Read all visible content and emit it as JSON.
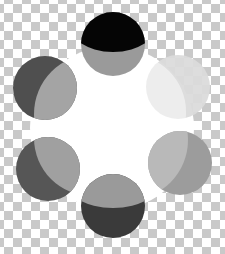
{
  "image": {
    "description": "Six overlapping two-tone grayscale circles arranged in a ring around a white center disc, on a transparency checkerboard background",
    "background": {
      "pattern": "checkerboard",
      "tile_px": 9,
      "colors": [
        "#ffffff",
        "#c9c9c9"
      ]
    },
    "center_disc": {
      "cx": 112,
      "cy": 128,
      "r": 82,
      "color": "#ffffff"
    },
    "circles": [
      {
        "name": "top",
        "cx": 113,
        "cy": 44,
        "r": 32,
        "dark": "#050505",
        "light": "#9a9a9a",
        "split": "horizontal-top-dark"
      },
      {
        "name": "upper-right",
        "cx": 178,
        "cy": 87,
        "r": 32,
        "dark": "#d9d9d9",
        "light": "#ebebeb",
        "split": "crescent-left-light"
      },
      {
        "name": "lower-right",
        "cx": 180,
        "cy": 163,
        "r": 32,
        "dark": "#9a9a9a",
        "light": "#b8b8b8",
        "split": "crescent-right-dark"
      },
      {
        "name": "bottom",
        "cx": 113,
        "cy": 206,
        "r": 32,
        "dark": "#3a3a3a",
        "light": "#9a9a9a",
        "split": "horizontal-bottom-dark"
      },
      {
        "name": "lower-left",
        "cx": 48,
        "cy": 169,
        "r": 32,
        "dark": "#555555",
        "light": "#9f9f9f",
        "split": "crescent-left-dark"
      },
      {
        "name": "upper-left",
        "cx": 45,
        "cy": 88,
        "r": 32,
        "dark": "#4f4f4f",
        "light": "#a3a3a3",
        "split": "crescent-left-dark"
      }
    ]
  }
}
